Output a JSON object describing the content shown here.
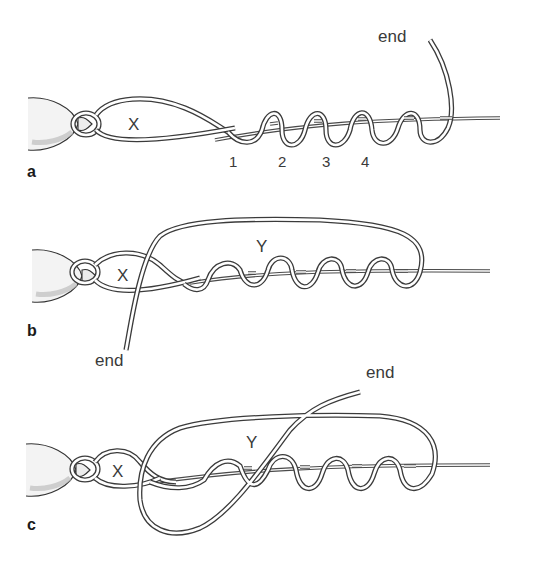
{
  "diagram": {
    "panels": [
      {
        "id": "a",
        "label": "a",
        "loop_label": "X",
        "end_label": "end",
        "turn_labels": [
          "1",
          "2",
          "3",
          "4"
        ]
      },
      {
        "id": "b",
        "label": "b",
        "loop_label": "X",
        "big_loop_label": "Y",
        "end_label": "end"
      },
      {
        "id": "c",
        "label": "c",
        "loop_label": "X",
        "big_loop_label": "Y",
        "end_label": "end"
      }
    ]
  }
}
